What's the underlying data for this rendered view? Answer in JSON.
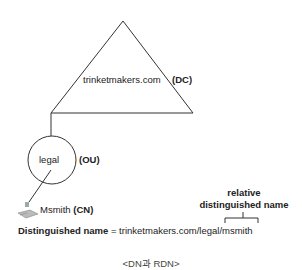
{
  "diagram": {
    "domain_component": {
      "name": "trinketmakers.com",
      "tag": "(DC)"
    },
    "organizational_unit": {
      "name": "legal",
      "tag": "(OU)"
    },
    "common_name": {
      "name": "Msmith",
      "tag": "(CN)",
      "icon": "computer-icon"
    },
    "distinguished_name": {
      "label": "Distinguished name",
      "equals": " = ",
      "path_prefix": "trinketmakers.com/legal/",
      "rdn_part": "msmith"
    },
    "rdn_label": {
      "line1": "relative",
      "line2": "distinguished name"
    },
    "caption": "<DN과 RDN>",
    "colors": {
      "stroke": "#333333",
      "text": "#222222"
    }
  }
}
